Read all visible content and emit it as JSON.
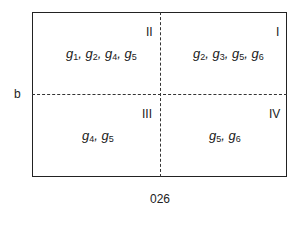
{
  "diagram": {
    "y_label": "b",
    "x_label": "026",
    "quadrants": [
      {
        "id": "I",
        "label": "I",
        "sets": [
          [
            "g",
            "2"
          ],
          [
            "g",
            "3"
          ],
          [
            "g",
            "5"
          ],
          [
            "g",
            "6"
          ]
        ]
      },
      {
        "id": "II",
        "label": "II",
        "sets": [
          [
            "g",
            "1"
          ],
          [
            "g",
            "2"
          ],
          [
            "g",
            "4"
          ],
          [
            "g",
            "5"
          ]
        ]
      },
      {
        "id": "III",
        "label": "III",
        "sets": [
          [
            "g",
            "4"
          ],
          [
            "g",
            "5"
          ]
        ]
      },
      {
        "id": "IV",
        "label": "IV",
        "sets": [
          [
            "g",
            "5"
          ],
          [
            "g",
            "6"
          ]
        ]
      }
    ]
  }
}
